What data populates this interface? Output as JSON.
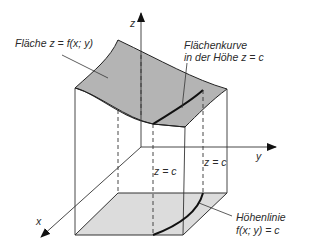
{
  "axes": {
    "x_label": "x",
    "y_label": "y",
    "z_label": "z"
  },
  "labels": {
    "surface": "Fläche z = f(x; y)",
    "surface_curve_line1": "Flächenkurve",
    "surface_curve_line2": "in der Höhe z = c",
    "height_back": "z = c",
    "height_front": "z = c",
    "contour_line1": "Höhenlinie",
    "contour_line2": "f(x; y) = c"
  },
  "colors": {
    "surface_fill": "#b4b4b4",
    "floor_fill": "#dcdcdc",
    "line": "#333333",
    "curve": "#111111"
  }
}
